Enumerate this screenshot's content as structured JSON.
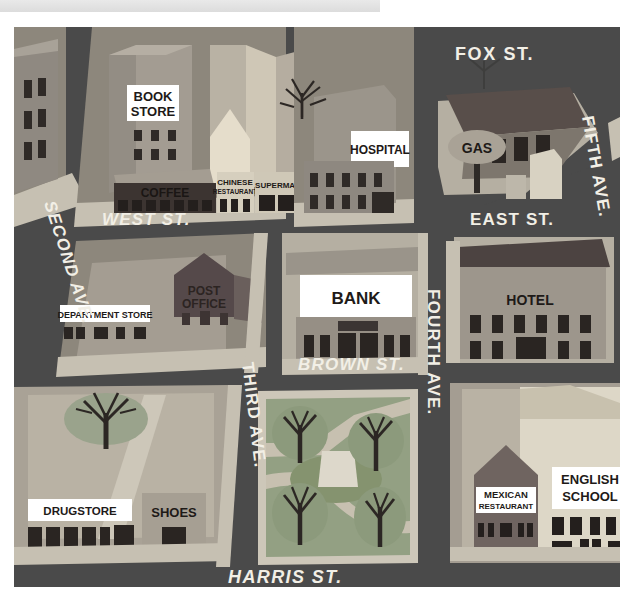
{
  "document": {
    "title": "Illustrated city street map",
    "type": "map-illustration"
  },
  "topbar": {
    "label": ""
  },
  "palette": {
    "road": "#4a4a4a",
    "road_dark": "#3f3f3f",
    "sidewalk": "#cfc9bc",
    "block_light": "#b9b3a6",
    "block_mid": "#9a948a",
    "roof_red": "#c1604f",
    "roof_teal": "#6f8f8a",
    "roof_cream": "#ddd6c4",
    "roof_dark": "#5b4c49",
    "wall_light": "#d9d3c2",
    "wall_mid": "#a9a295",
    "wall_dark": "#4f4644",
    "park_green": "#93a083",
    "park_green_dark": "#7f8d70",
    "tree_crown": "#8d9b7e",
    "tree_trunk": "#3b342f",
    "window_dark": "#2f2a27",
    "sign_white": "#ffffff",
    "label_white": "#f2efe6",
    "label_dark": "#241f1d"
  },
  "streets": [
    {
      "name": "FOX ST.",
      "id": "fox-st",
      "orientation": "horizontal",
      "x": 455,
      "y": 57,
      "rotate": 0,
      "size": 18,
      "color": "#f2efe6"
    },
    {
      "name": "WEST ST.",
      "id": "west-st",
      "orientation": "horizontal",
      "x": 102,
      "y": 216,
      "rotate": 0,
      "size": 17,
      "color": "#f2efe6"
    },
    {
      "name": "EAST ST.",
      "id": "east-st",
      "orientation": "horizontal",
      "x": 470,
      "y": 216,
      "rotate": 0,
      "size": 17,
      "color": "#f2efe6"
    },
    {
      "name": "BROWN ST.",
      "id": "brown-st",
      "orientation": "horizontal",
      "x": 298,
      "y": 358,
      "rotate": 0,
      "size": 17,
      "color": "#f2efe6"
    },
    {
      "name": "HARRIS ST.",
      "id": "harris-st",
      "orientation": "horizontal",
      "x": 228,
      "y": 582,
      "rotate": 0,
      "size": 18,
      "color": "#f2efe6"
    },
    {
      "name": "SECOND AVE.",
      "id": "second-ave",
      "orientation": "diagonal",
      "x": 36,
      "y": 196,
      "rotate": 72,
      "size": 17,
      "color": "#f2efe6"
    },
    {
      "name": "THIRD AVE.",
      "id": "third-ave",
      "orientation": "vertical",
      "x": 232,
      "y": 360,
      "rotate": 82,
      "size": 17,
      "color": "#f2efe6"
    },
    {
      "name": "FOURTH AVE.",
      "id": "fourth-ave",
      "orientation": "vertical",
      "x": 421,
      "y": 283,
      "rotate": 90,
      "size": 17,
      "color": "#f2efe6"
    },
    {
      "name": "FIFTH AVE.",
      "id": "fifth-ave",
      "orientation": "diagonal",
      "x": 575,
      "y": 113,
      "rotate": 80,
      "size": 17,
      "color": "#f2efe6"
    }
  ],
  "places": [
    {
      "id": "book-store",
      "label": "BOOK\nSTORE",
      "sign": "white-plaque",
      "lines": [
        "BOOK",
        "STORE"
      ]
    },
    {
      "id": "coffee",
      "label": "COFFEE",
      "sign": "dark-facade",
      "lines": [
        "COFFEE"
      ]
    },
    {
      "id": "chinese-restaurant",
      "label": "CHINESE\nRESTAURANT",
      "sign": "light-facade",
      "lines": [
        "CHINESE",
        "RESTAURANT"
      ]
    },
    {
      "id": "supermarket",
      "label": "SUPERMARKET",
      "sign": "light-facade",
      "lines": [
        "SUPERMARKET"
      ]
    },
    {
      "id": "hospital",
      "label": "HOSPITAL",
      "sign": "white-plaque",
      "lines": [
        "HOSPITAL"
      ]
    },
    {
      "id": "gas",
      "label": "GAS",
      "sign": "pole-oval",
      "lines": [
        "GAS"
      ]
    },
    {
      "id": "hotel",
      "label": "HOTEL",
      "sign": "facade-text",
      "lines": [
        "HOTEL"
      ]
    },
    {
      "id": "post-office",
      "label": "POST\nOFFICE",
      "sign": "facade-text",
      "lines": [
        "POST",
        "OFFICE"
      ]
    },
    {
      "id": "department-store",
      "label": "DEPARTMENT STORE",
      "sign": "white-plaque",
      "lines": [
        "DEPARTMENT STORE"
      ]
    },
    {
      "id": "bank",
      "label": "BANK",
      "sign": "white-plaque",
      "lines": [
        "BANK"
      ]
    },
    {
      "id": "drugstore",
      "label": "DRUGSTORE",
      "sign": "white-plaque",
      "lines": [
        "DRUGSTORE"
      ]
    },
    {
      "id": "shoes",
      "label": "SHOES",
      "sign": "facade-text",
      "lines": [
        "SHOES"
      ]
    },
    {
      "id": "mexican-restaurant",
      "label": "MEXICAN\nRESTAURANT",
      "sign": "white-plaque",
      "lines": [
        "MEXICAN",
        "RESTAURANT"
      ]
    },
    {
      "id": "english-school",
      "label": "ENGLISH\nSCHOOL",
      "sign": "white-plaque",
      "lines": [
        "ENGLISH",
        "SCHOOL"
      ]
    }
  ],
  "labels": {
    "book_store_1": "BOOK",
    "book_store_2": "STORE",
    "coffee": "COFFEE",
    "chinese_1": "CHINESE",
    "chinese_2": "RESTAURANT",
    "supermarket": "SUPERMARKET",
    "hospital": "HOSPITAL",
    "gas": "GAS",
    "hotel": "HOTEL",
    "post_office_1": "POST",
    "post_office_2": "OFFICE",
    "department_store": "DEPARTMENT STORE",
    "bank": "BANK",
    "drugstore": "DRUGSTORE",
    "shoes": "SHOES",
    "mexican_1": "MEXICAN",
    "mexican_2": "RESTAURANT",
    "english_school_1": "ENGLISH",
    "english_school_2": "SCHOOL",
    "fox_st": "FOX ST.",
    "west_st": "WEST ST.",
    "east_st": "EAST ST.",
    "brown_st": "BROWN ST.",
    "harris_st": "HARRIS ST.",
    "second_ave": "SECOND AVE.",
    "third_ave": "THIRD AVE.",
    "fourth_ave": "FOURTH AVE.",
    "fifth_ave": "FIFTH AVE."
  },
  "features": {
    "park": {
      "trees": 4,
      "monument": true,
      "paths": 2
    },
    "lower_left_block": {
      "trees": 1
    },
    "hospital_block": {
      "trees": 1
    },
    "fox_st_block": {
      "trees": 1
    }
  }
}
